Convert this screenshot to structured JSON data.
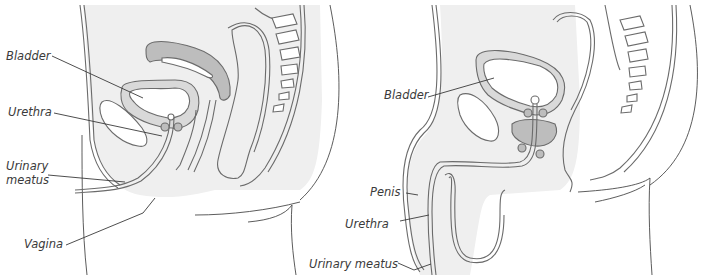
{
  "figure": {
    "panels": [
      {
        "id": "female",
        "labels": [
          {
            "key": "bladder",
            "text": "Bladder"
          },
          {
            "key": "urethra",
            "text": "Urethra"
          },
          {
            "key": "urinary_meatus_line1",
            "text": "Urinary"
          },
          {
            "key": "urinary_meatus_line2",
            "text": "meatus"
          },
          {
            "key": "vagina",
            "text": "Vagina"
          }
        ]
      },
      {
        "id": "male",
        "labels": [
          {
            "key": "bladder",
            "text": "Bladder"
          },
          {
            "key": "penis",
            "text": "Penis"
          },
          {
            "key": "urethra",
            "text": "Urethra"
          },
          {
            "key": "urinary_meatus",
            "text": "Urinary meatus"
          }
        ]
      }
    ],
    "colors": {
      "outline": "#6b6b6b",
      "tissue_fill": "#efefef",
      "wall_fill": "#d9d9d9",
      "dark_fill": "#bdbdbd",
      "label_text": "#3a3a3a"
    }
  }
}
